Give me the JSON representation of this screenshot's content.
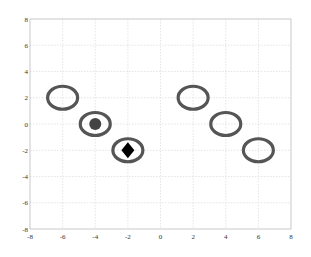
{
  "chart_data": {
    "type": "scatter",
    "title": "",
    "xlabel": "",
    "ylabel": "",
    "xlim": [
      -8,
      8
    ],
    "ylim": [
      -8,
      8
    ],
    "grid": true,
    "legend": null,
    "x_ticks": [
      "-8",
      "-6",
      "-4",
      "-2",
      "0",
      "2",
      "4",
      "6",
      "8"
    ],
    "y_ticks": [
      "8",
      "6",
      "4",
      "2",
      "0",
      "-2",
      "-4",
      "-6",
      "-8"
    ],
    "series": [
      {
        "name": "ellipses",
        "marker": "open-ellipse",
        "color": "#555555",
        "points": [
          {
            "x": -6,
            "y": 2
          },
          {
            "x": -4,
            "y": 0
          },
          {
            "x": -2,
            "y": -2
          },
          {
            "x": 2,
            "y": 2
          },
          {
            "x": 4,
            "y": 0
          },
          {
            "x": 6,
            "y": -2
          }
        ]
      },
      {
        "name": "filled-circle",
        "marker": "circle",
        "color": "#444444",
        "points": [
          {
            "x": -4,
            "y": 0
          }
        ]
      },
      {
        "name": "diamond",
        "marker": "diamond",
        "color": "#000000",
        "points": [
          {
            "x": -2,
            "y": -2
          }
        ]
      }
    ]
  },
  "colors": {
    "axis": "#bbbbbb",
    "grid": "#dddddd",
    "ellipse_stroke": "#555555",
    "circle_fill": "#444444",
    "diamond_fill": "#000000"
  }
}
